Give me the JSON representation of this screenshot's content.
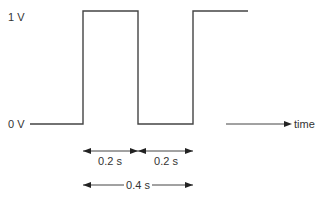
{
  "diagram": {
    "type": "square-wave",
    "labels": {
      "high_level": "1 V",
      "low_level": "0 V",
      "time_axis": "time",
      "low_duration": "0.2 s",
      "high_duration": "0.2 s",
      "period": "0.4 s"
    },
    "colors": {
      "line": "#444444",
      "text": "#333333",
      "background": "#ffffff"
    }
  }
}
